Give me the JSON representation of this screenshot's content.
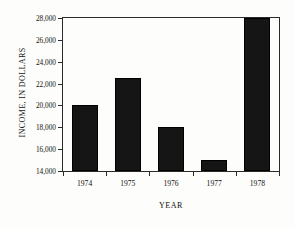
{
  "chart_data": {
    "type": "bar",
    "title": "",
    "xlabel": "YEAR",
    "ylabel": "INCOME, IN DOLLARS",
    "categories": [
      "1974",
      "1975",
      "1976",
      "1977",
      "1978"
    ],
    "values": [
      20000,
      22500,
      18000,
      15000,
      28000
    ],
    "ylim": [
      14000,
      28000
    ],
    "yticks": [
      14000,
      16000,
      18000,
      20000,
      22000,
      24000,
      26000,
      28000
    ],
    "ytick_labels": [
      "14,000",
      "16,000",
      "18,000",
      "20,000",
      "22,000",
      "24,000",
      "26,000",
      "28,000"
    ],
    "grid": false,
    "legend": null,
    "bar_color": "#151515",
    "axis_color": "#2a2a2a",
    "background_color": "#fdfdfb"
  }
}
